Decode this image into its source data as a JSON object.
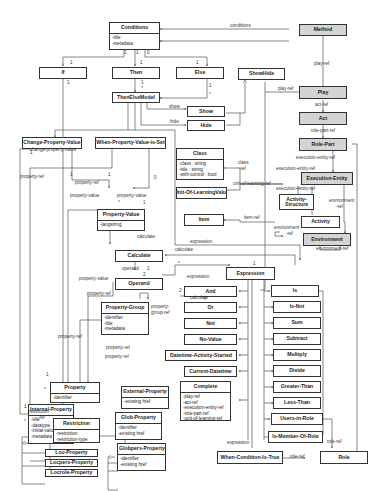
{
  "diagram": {
    "type": "uml-class-diagram",
    "classes": {
      "conditions": {
        "name": "Conditions",
        "attrs": [
          "-title",
          "-metadata"
        ]
      },
      "method": {
        "name": "Method"
      },
      "if": {
        "name": "If"
      },
      "then": {
        "name": "Then"
      },
      "else": {
        "name": "Else"
      },
      "thenelsemodel": {
        "name": "ThenElseModel"
      },
      "showhide": {
        "name": "ShowHide"
      },
      "show": {
        "name": "Show"
      },
      "hide": {
        "name": "Hide"
      },
      "play": {
        "name": "Play"
      },
      "act": {
        "name": "Act"
      },
      "rolepart": {
        "name": "Role-Part"
      },
      "executionentity": {
        "name": "Execution-Entity"
      },
      "activitystructure": {
        "name": "Activity-Structure"
      },
      "activity": {
        "name": "Activity"
      },
      "environment": {
        "name": "Environment"
      },
      "class": {
        "name": "Class",
        "attrs": [
          "-class : string",
          "-title : string",
          "-with-control : bool"
        ]
      },
      "unitoflearningvalue": {
        "name": "Unit-Of-LearningValue"
      },
      "item": {
        "name": "Item"
      },
      "changepropertyvalue": {
        "name": "Change-Property-Value"
      },
      "whenpropertyvalueisset": {
        "name": "When-Property-Value-is-Set"
      },
      "propertyvalue": {
        "name": "Property-Value",
        "attrs": [
          "-langstring"
        ]
      },
      "calculate": {
        "name": "Calculate"
      },
      "operand": {
        "name": "Operand"
      },
      "propertygroup": {
        "name": "Property-Group",
        "attrs": [
          "-identifier",
          "-title",
          "-metadata"
        ]
      },
      "expression": {
        "name": "Expression"
      },
      "and": {
        "name": "And"
      },
      "or": {
        "name": "Or"
      },
      "not": {
        "name": "Not"
      },
      "novalue": {
        "name": "No-Value"
      },
      "datetimeactivitystarted": {
        "name": "Datetime-Activity-Started"
      },
      "currentdatetime": {
        "name": "Current-Datetime"
      },
      "complete": {
        "name": "Complete",
        "attrs": [
          "-play-ref",
          "-act-ref",
          "-execution-entity-ref",
          "-role-part-ref",
          "-unit-of-learning-ref"
        ]
      },
      "is": {
        "name": "Is"
      },
      "isnot": {
        "name": "Is-Not"
      },
      "sum": {
        "name": "Sum"
      },
      "subtract": {
        "name": "Subtract"
      },
      "multiply": {
        "name": "Multiply"
      },
      "divide": {
        "name": "Divide"
      },
      "greaterthan": {
        "name": "Greater-Than"
      },
      "lessthan": {
        "name": "Less-Than"
      },
      "usersinrole": {
        "name": "Users-in-Role"
      },
      "ismemberofrole": {
        "name": "Is-Member-Of-Role"
      },
      "whenconditionistrue": {
        "name": "When-Condition-Is-True"
      },
      "role": {
        "name": "Role"
      },
      "property": {
        "name": "Property",
        "attrs": [
          "-identifier"
        ]
      },
      "internalproperty": {
        "name": "Internal-Property",
        "attrs": [
          "-title",
          "-datatype",
          "-initial-value",
          "-metadata"
        ]
      },
      "externalproperty": {
        "name": "External-Property",
        "attrs": [
          "-existing href"
        ]
      },
      "restriction": {
        "name": "Restriction",
        "attrs": [
          "-restriction",
          "-restriction-type"
        ]
      },
      "globproperty": {
        "name": "Glob-Property",
        "attrs": [
          "-identifier",
          "-existing href"
        ]
      },
      "globpersproperty": {
        "name": "Globpers-Property",
        "attrs": [
          "-identifier",
          "-existing href"
        ]
      },
      "locproperty": {
        "name": "Loc-Property"
      },
      "locpersproperty": {
        "name": "Locpers-Property"
      },
      "locroleproperty": {
        "name": "Locrole-Property"
      }
    },
    "labels": {
      "conditions": "conditions",
      "play_ref_method": "play-ref",
      "play_ref_showhide": "play-ref",
      "act_ref": "act-ref",
      "role_part_ref": "role-part-ref",
      "execution_entity_ref_1": "execution-entity-ref",
      "execution_entity_ref_2": "execution-entity-ref",
      "execution_entity_ref_3": "execution-entity-ref",
      "class_ref": "class\n-ref",
      "class_ref_a": "class",
      "class_ref_b": "-ref",
      "unit_of_learning_ref": "unit-of-learning-ref",
      "item_ref": "item-ref",
      "environment_ref_a1": "environment",
      "environment_ref_a2": "-ref",
      "environment_ref_b1": "environment",
      "environment_ref_b2": "-ref",
      "environment_ref_c": "environment-ref",
      "show": "show",
      "hide": "hide",
      "change_property_value": "change-property-value",
      "property_ref_1": "property-ref",
      "property_ref_2": "property-ref",
      "property_ref_3": "property-ref",
      "property_ref_4": "property-ref",
      "property_ref_5": "property-ref",
      "property_ref_6": "property-ref",
      "property_value_1": "property-value",
      "property_value_2": "property-value",
      "property_value_3": "property-value",
      "calculate_1": "calculate",
      "calculate_2": "calculate",
      "calculate_3": "calculate",
      "operand": "operand",
      "expression_1": "expression",
      "expression_2": "expression",
      "expression_3": "expression",
      "property_group_ref_a": "property-",
      "property_group_ref_b": "group-ref",
      "restriction_ref_a": "restriction",
      "restriction_ref_b": "-ref",
      "role_ref_1": "role-ref",
      "role_ref_2": "role-ref"
    },
    "multiplicities": {
      "c_if": "1",
      "if_c": "1",
      "c_then": "1",
      "then_c": "1",
      "c_else": "0",
      "else_c": "1",
      "if_below": "1",
      "then_below": "1",
      "tem_then": "*",
      "else_below": "1",
      "tem_else": "*",
      "cpv_1": "1",
      "cpv_2": "1",
      "wpv_1": "1",
      "wpv_2": "0",
      "pv_star": "*",
      "pv_1": "1",
      "op_2a": "2",
      "op_2b": "2",
      "calc_star": "*",
      "expr_1": "1",
      "calc_2": "2",
      "prop_1": "1",
      "prop_star": "*",
      "ip_1": "1",
      "ip_star": "*"
    }
  }
}
